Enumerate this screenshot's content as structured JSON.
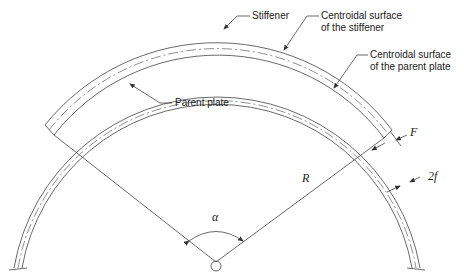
{
  "diagram": {
    "type": "curved stiffened plate cross-section",
    "labels": {
      "stiffener": "Stiffener",
      "centroid_stiffener_1": "Centroidal surface",
      "centroid_stiffener_2": "of the stiffener",
      "centroid_parent_1": "Centroidal surface",
      "centroid_parent_2": "of the parent plate",
      "parent_plate": "Parent plate",
      "radius": "R",
      "angle": "α",
      "stiffener_thickness": "F",
      "plate_thickness": "2f"
    },
    "colors": {
      "line": "#3a3a3a",
      "background": "#ffffff"
    }
  }
}
